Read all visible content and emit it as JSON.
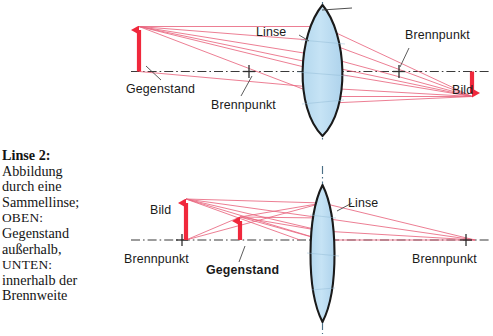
{
  "figure": {
    "caption": {
      "title": "Linse 2:",
      "lines": [
        "Abbildung",
        "durch eine",
        "Sammellinse;"
      ],
      "upper_marker": "OBEN:",
      "upper_lines": [
        "Gegenstand",
        "außerhalb,"
      ],
      "lower_marker": "UNTEN:",
      "lower_lines": [
        "innerhalb der",
        "Brennweite"
      ]
    },
    "colors": {
      "ray": "#e8677f",
      "arrow": "#f0283c",
      "lens_fill": "#bcdcf0",
      "lens_stroke": "#1a1a1a",
      "axis": "#3a3a3a",
      "text": "#1a1a1a",
      "background": "#ffffff"
    },
    "upper_diagram": {
      "name": "Gegenstand außerhalb der Brennweite",
      "labels": {
        "lens": "Linse",
        "object": "Gegenstand",
        "focal_left": "Brennpunkt",
        "focal_right": "Brennpunkt",
        "image": "Bild"
      },
      "object_arrow_direction": "up",
      "image_arrow_direction": "down"
    },
    "lower_diagram": {
      "name": "Gegenstand innerhalb der Brennweite",
      "labels": {
        "lens": "Linse",
        "object": "Gegenstand",
        "focal_left": "Brennpunkt",
        "focal_right": "Brennpunkt",
        "image": "Bild"
      },
      "object_arrow_direction": "up",
      "image_arrow_direction": "up"
    }
  }
}
